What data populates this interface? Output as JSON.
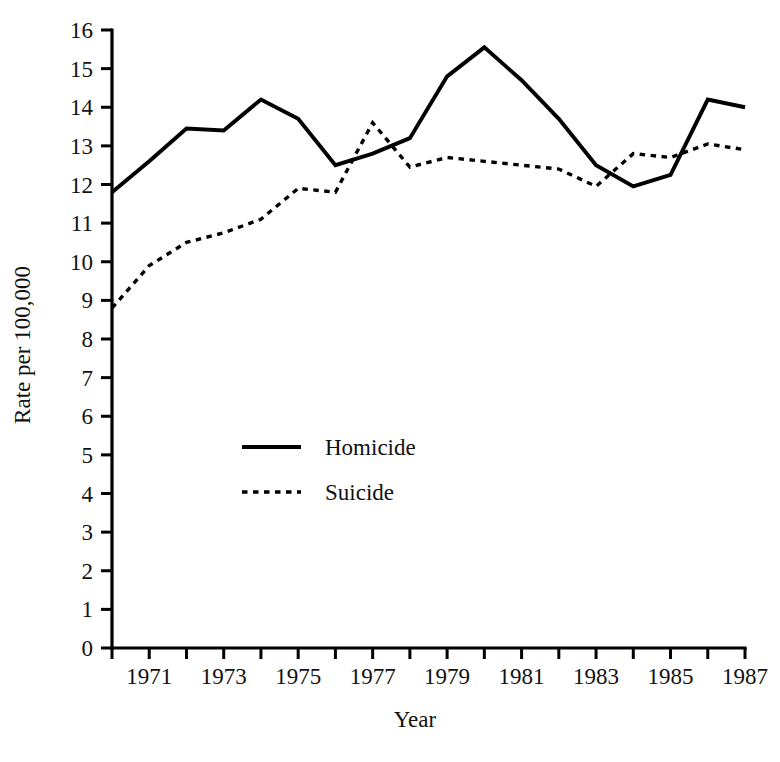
{
  "chart_data": {
    "type": "line",
    "title": "",
    "subtitle": "",
    "xlabel": "Year",
    "ylabel": "Rate per 100,000",
    "x": [
      1970,
      1971,
      1972,
      1973,
      1974,
      1975,
      1976,
      1977,
      1978,
      1979,
      1980,
      1981,
      1982,
      1983,
      1984,
      1985,
      1986,
      1987
    ],
    "xlim": [
      1970,
      1987
    ],
    "ylim": [
      0,
      16
    ],
    "xticks": [
      1970,
      1971,
      1972,
      1973,
      1974,
      1975,
      1976,
      1977,
      1978,
      1979,
      1980,
      1981,
      1982,
      1983,
      1984,
      1985,
      1986,
      1987
    ],
    "xtick_labels": [
      "",
      "1971",
      "",
      "1973",
      "",
      "1975",
      "",
      "1977",
      "",
      "1979",
      "",
      "1981",
      "",
      "1983",
      "",
      "1985",
      "",
      "1987"
    ],
    "yticks": [
      0,
      1,
      2,
      3,
      4,
      5,
      6,
      7,
      8,
      9,
      10,
      11,
      12,
      13,
      14,
      15,
      16
    ],
    "ytick_labels": [
      "0",
      "1",
      "2",
      "3",
      "4",
      "5",
      "6",
      "7",
      "8",
      "9",
      "10",
      "11",
      "12",
      "13",
      "14",
      "15",
      "16"
    ],
    "grid": false,
    "legend_position": "center-left-inside",
    "series": [
      {
        "name": "Homicide",
        "style": "solid",
        "color": "#000000",
        "values": [
          11.8,
          12.6,
          13.45,
          13.4,
          14.2,
          13.7,
          12.5,
          12.8,
          13.2,
          14.8,
          15.55,
          14.7,
          13.7,
          12.5,
          11.95,
          12.25,
          14.2,
          14.0
        ]
      },
      {
        "name": "Suicide",
        "style": "dotted",
        "color": "#000000",
        "values": [
          8.8,
          9.9,
          10.5,
          10.75,
          11.1,
          11.9,
          11.8,
          13.6,
          12.45,
          12.7,
          12.6,
          12.5,
          12.4,
          11.95,
          12.8,
          12.7,
          13.05,
          12.9
        ]
      }
    ],
    "legend": [
      {
        "label": "Homicide",
        "style": "solid"
      },
      {
        "label": "Suicide",
        "style": "dotted"
      }
    ]
  }
}
